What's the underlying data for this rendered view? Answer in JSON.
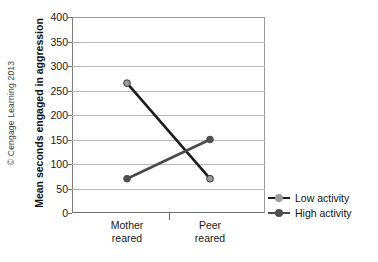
{
  "figure": {
    "credit": "© Cengage Learning 2013"
  },
  "chart_data": {
    "type": "line",
    "title": "",
    "subtitle": "",
    "xlabel": "",
    "ylabel": "Mean seconds engaged in aggression",
    "categories": [
      "Mother reared",
      "Peer reared"
    ],
    "category_lines": [
      [
        "Mother",
        "reared"
      ],
      [
        "Peer",
        "reared"
      ]
    ],
    "ylim": [
      0,
      400
    ],
    "yticks": [
      0,
      50,
      100,
      150,
      200,
      250,
      300,
      350,
      400
    ],
    "ytick_labels": [
      "0",
      "50",
      "100",
      "150",
      "200",
      "250",
      "300",
      "350",
      "400"
    ],
    "grid": "horizontal",
    "legend_position": "right",
    "series": [
      {
        "name": "Low activity",
        "values": [
          265,
          70
        ],
        "color": "#1c1c1c",
        "marker_color": "#9b9b9b"
      },
      {
        "name": "High activity",
        "values": [
          70,
          150
        ],
        "color": "#4a4a4a",
        "marker_color": "#4f4f4f"
      }
    ]
  }
}
